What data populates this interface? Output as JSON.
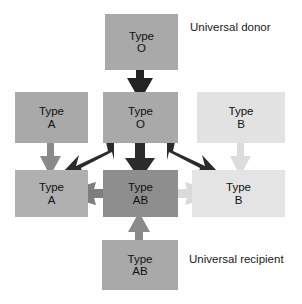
{
  "diagram": {
    "title_text": "Blood type transfusion compatibility",
    "background_color": "#ffffff",
    "boxes": [
      {
        "id": "donor-o",
        "line1": "Type",
        "line2": "O",
        "color": "#a9a9a9",
        "x": 105,
        "y": 14,
        "w": 73,
        "h": 56
      },
      {
        "id": "mid-a",
        "line1": "Type",
        "line2": "A",
        "color": "#a9a9a9",
        "x": 15,
        "y": 92,
        "w": 73,
        "h": 51
      },
      {
        "id": "mid-o",
        "line1": "Type",
        "line2": "O",
        "color": "#a9a9a9",
        "x": 103,
        "y": 92,
        "w": 75,
        "h": 51
      },
      {
        "id": "mid-b",
        "line1": "Type",
        "line2": "B",
        "color": "#e2e2e2",
        "x": 197,
        "y": 92,
        "w": 88,
        "h": 51
      },
      {
        "id": "recip-a",
        "line1": "Type",
        "line2": "A",
        "color": "#b0b0b0",
        "x": 15,
        "y": 170,
        "w": 73,
        "h": 47
      },
      {
        "id": "recip-ab",
        "line1": "Type",
        "line2": "AB",
        "color": "#8e8e8e",
        "x": 103,
        "y": 170,
        "w": 75,
        "h": 47
      },
      {
        "id": "recip-b",
        "line1": "Type",
        "line2": "B",
        "color": "#e4e4e4",
        "x": 192,
        "y": 170,
        "w": 93,
        "h": 47
      },
      {
        "id": "recip-ab-bottom",
        "line1": "Type",
        "line2": "AB",
        "color": "#a9a9a9",
        "x": 102,
        "y": 240,
        "w": 76,
        "h": 50
      }
    ],
    "captions": [
      {
        "id": "universal-donor",
        "text": "Universal donor",
        "x": 190,
        "y": 21
      },
      {
        "id": "universal-recipient",
        "text": "Universal recipient",
        "x": 189,
        "y": 253
      }
    ],
    "arrows": [
      {
        "id": "o-donor-to-o",
        "color": "#242424",
        "direction": "down"
      },
      {
        "id": "o-to-a",
        "color": "#2b2b2b",
        "direction": "down-left"
      },
      {
        "id": "o-to-ab",
        "color": "#2b2b2b",
        "direction": "down"
      },
      {
        "id": "o-to-b",
        "color": "#2b2b2b",
        "direction": "down-right"
      },
      {
        "id": "a-to-a",
        "color": "#8a8a8a",
        "direction": "down"
      },
      {
        "id": "b-to-b",
        "color": "#dcdcdc",
        "direction": "down"
      },
      {
        "id": "a-to-ab",
        "color": "#7e7e7e",
        "direction": "right"
      },
      {
        "id": "b-to-ab",
        "color": "#dadada",
        "direction": "left"
      },
      {
        "id": "ab-bottom-to-ab",
        "color": "#8a8a8a",
        "direction": "up"
      }
    ]
  }
}
